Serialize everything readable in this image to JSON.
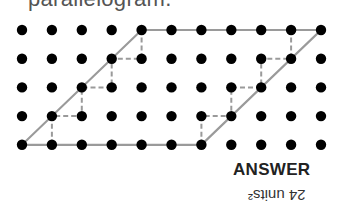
{
  "question": {
    "text": "parallelogram."
  },
  "grid": {
    "cols": 11,
    "rows": 5,
    "origin_x": 22,
    "origin_y": 30,
    "dx": 29.9,
    "dy": 28.7,
    "dot_radius": 5.2,
    "dot_color": "#000000"
  },
  "parallelogram": {
    "vertices": [
      [
        0,
        4
      ],
      [
        6,
        4
      ],
      [
        10,
        0
      ],
      [
        4,
        0
      ]
    ],
    "stroke": "#9a9a9a"
  },
  "dashed_staircases": [
    [
      [
        1,
        4
      ],
      [
        1,
        3
      ],
      [
        2,
        3
      ],
      [
        2,
        2
      ],
      [
        3,
        2
      ],
      [
        3,
        1
      ],
      [
        4,
        1
      ],
      [
        4,
        0
      ]
    ],
    [
      [
        6,
        4
      ],
      [
        6,
        3
      ],
      [
        7,
        3
      ],
      [
        7,
        2
      ],
      [
        8,
        2
      ],
      [
        8,
        1
      ],
      [
        9,
        1
      ],
      [
        9,
        0
      ]
    ]
  ],
  "dash_color": "#9a9a9a",
  "answer": {
    "label": "ANSWER",
    "value": "24 units²"
  }
}
